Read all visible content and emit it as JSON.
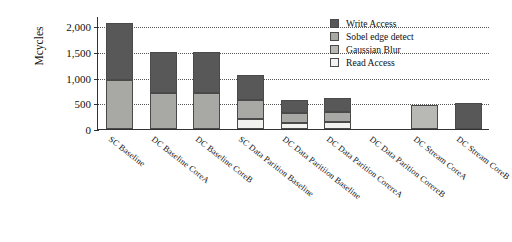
{
  "chart_data": {
    "type": "bar",
    "subtype": "stacked",
    "title": "",
    "xlabel": "",
    "ylabel": "Mcycles",
    "ylim": [
      0,
      2200
    ],
    "yticks": [
      0,
      500,
      1000,
      1500,
      2000
    ],
    "ytick_labels": [
      "0",
      "500",
      "1,000",
      "1,500",
      "2,000"
    ],
    "grid": true,
    "grid_style": "dotted",
    "legend_position": "top-right",
    "categories": [
      "SC Baseline",
      "DC Baseline CoreA",
      "DC Baseline CoreB",
      "SC Data Parition Baseline",
      "DC Data Paritiion Baseline",
      "DC Data Parition CorereA",
      "DC Data Parition CorereB",
      "DC Stream CoreA",
      "DC Stream CoreB"
    ],
    "series": [
      {
        "name": "Read Access",
        "color": "#f2f2f0",
        "values": [
          0,
          0,
          0,
          200,
          120,
          130,
          0,
          0,
          0
        ]
      },
      {
        "name": "Gaussian Blur",
        "color": "#b8b8b4",
        "values": [
          0,
          0,
          0,
          0,
          0,
          0,
          0,
          470,
          0
        ]
      },
      {
        "name": "Sobel edge detect",
        "color": "#a8a8a4",
        "values": [
          950,
          710,
          710,
          360,
          190,
          200,
          0,
          0,
          0
        ]
      },
      {
        "name": "Write Access",
        "color": "#585858",
        "values": [
          1110,
          790,
          790,
          500,
          250,
          270,
          0,
          0,
          500
        ]
      }
    ],
    "bar_totals": [
      2060,
      1500,
      1500,
      1060,
      560,
      600,
      480,
      470,
      500
    ]
  },
  "legend": {
    "entries": [
      {
        "label": "Write Access",
        "color": "#585858"
      },
      {
        "label": "Sobel edge detect",
        "color": "#a8a8a4"
      },
      {
        "label": "Gaussian Blur",
        "color": "#b8b8b4"
      },
      {
        "label": "Read Access",
        "color": "#f2f2f0"
      }
    ]
  },
  "axis": {
    "y_title": "Mcycles"
  }
}
